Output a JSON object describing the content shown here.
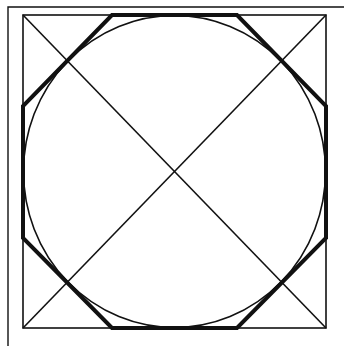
{
  "diagram": {
    "title": "",
    "colors": {
      "background": "#ffffff",
      "stroke": "#111111"
    },
    "outer_frame": {
      "x": 8,
      "y": 7,
      "right_open": true,
      "bottom_open": true
    },
    "square": {
      "x": 23,
      "y": 15,
      "width": 303,
      "height": 313,
      "stroke_width": 1.6
    },
    "circle": {
      "cx": 174.5,
      "cy": 171.5,
      "rx": 151,
      "ry": 156,
      "stroke_width": 1.6
    },
    "octagon": {
      "stroke_width": 4,
      "points": [
        [
          112,
          15
        ],
        [
          237,
          15
        ],
        [
          326,
          106
        ],
        [
          326,
          238
        ],
        [
          237,
          328
        ],
        [
          112,
          328
        ],
        [
          23,
          238
        ],
        [
          23,
          106
        ]
      ]
    },
    "diagonals": [
      {
        "x1": 23,
        "y1": 15,
        "x2": 326,
        "y2": 328
      },
      {
        "x1": 326,
        "y1": 15,
        "x2": 23,
        "y2": 328
      }
    ]
  }
}
